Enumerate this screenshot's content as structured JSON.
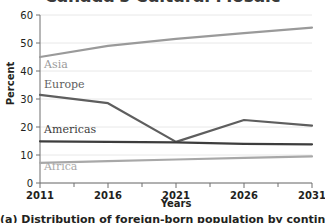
{
  "title": "Canada's Cultural Mosaic",
  "caption": "(a) Distribution of foreign-born population by continent",
  "axis": {
    "ylabel": "Percent",
    "xlabel": "Years"
  },
  "chart_data": {
    "type": "line",
    "title": "Canada's Cultural Mosaic",
    "xlabel": "Years",
    "ylabel": "Percent",
    "categories": [
      "2011",
      "2016",
      "2021",
      "2026",
      "2031"
    ],
    "x": [
      2011,
      2016,
      2021,
      2026,
      2031
    ],
    "xlim": [
      2011,
      2031
    ],
    "ylim": [
      0,
      60
    ],
    "yticks": [
      0,
      10,
      20,
      30,
      40,
      50,
      60
    ],
    "xticks": [
      2011,
      2016,
      2021,
      2026,
      2031
    ],
    "grid": true,
    "legend_position": "inline-labels",
    "series": [
      {
        "name": "Asia",
        "color": "#9a9a9a",
        "values": [
          45.0,
          49.0,
          51.5,
          53.5,
          55.5
        ],
        "label_x": 2011.3,
        "label_y": 41.0
      },
      {
        "name": "Europe",
        "color": "#5e5e5e",
        "values": [
          31.5,
          28.5,
          14.7,
          22.5,
          20.5
        ],
        "label_x": 2011.3,
        "label_y": 34.0
      },
      {
        "name": "Americas",
        "color": "#3d3d3d",
        "values": [
          14.9,
          14.7,
          14.5,
          14.0,
          13.8
        ],
        "label_x": 2011.3,
        "label_y": 17.8
      },
      {
        "name": "Africa",
        "color": "#a8a8a8",
        "values": [
          7.2,
          7.8,
          8.4,
          9.0,
          9.5
        ],
        "label_x": 2011.3,
        "label_y": 4.6
      }
    ]
  }
}
